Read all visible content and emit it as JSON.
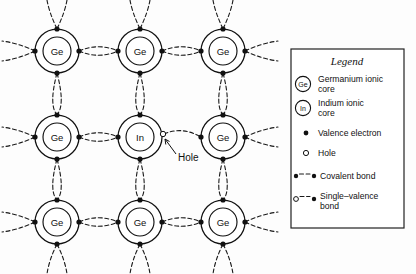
{
  "figure": {
    "type": "semiconductor-lattice-diagram",
    "background_color": "#fdfdfd",
    "ink_color": "#111111"
  },
  "lattice": {
    "rows": 3,
    "cols": 3,
    "col_x": [
      57,
      140,
      223
    ],
    "row_y": [
      51,
      137,
      222
    ],
    "outer_radius": 22,
    "inner_radius": 14,
    "atoms": [
      {
        "label": "Ge",
        "row": 0,
        "col": 0
      },
      {
        "label": "Ge",
        "row": 0,
        "col": 1
      },
      {
        "label": "Ge",
        "row": 0,
        "col": 2
      },
      {
        "label": "Ge",
        "row": 1,
        "col": 0
      },
      {
        "label": "In",
        "row": 1,
        "col": 1
      },
      {
        "label": "Ge",
        "row": 1,
        "col": 2
      },
      {
        "label": "Ge",
        "row": 2,
        "col": 0
      },
      {
        "label": "Ge",
        "row": 2,
        "col": 1
      },
      {
        "label": "Ge",
        "row": 2,
        "col": 2
      }
    ]
  },
  "annotation": {
    "hole_label": "Hole",
    "hole_label_x": 178,
    "hole_label_y": 158
  },
  "legend": {
    "title": "Legend",
    "box": {
      "x": 291,
      "y": 49,
      "width": 113,
      "height": 179
    },
    "items": [
      {
        "symbol": "germanium-core-icon",
        "symbol_label": "Ge",
        "line1": "Germanium ionic",
        "line2": "core"
      },
      {
        "symbol": "indium-core-icon",
        "symbol_label": "In",
        "line1": "Indium ionic",
        "line2": "core"
      },
      {
        "symbol": "valence-electron-icon",
        "symbol_label": "",
        "line1": "Valence electron",
        "line2": ""
      },
      {
        "symbol": "hole-icon",
        "symbol_label": "",
        "line1": "Hole",
        "line2": ""
      },
      {
        "symbol": "covalent-bond-icon",
        "symbol_label": "",
        "line1": "Covalent bond",
        "line2": ""
      },
      {
        "symbol": "single-valence-bond-icon",
        "symbol_label": "",
        "line1": "Single–valence",
        "line2": "bond"
      }
    ]
  }
}
